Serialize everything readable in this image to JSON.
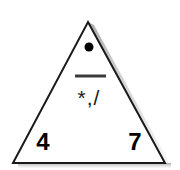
{
  "figure": {
    "shape": "triangle",
    "apex": {
      "x": 88,
      "y": 22
    },
    "bottom_left": {
      "x": 13,
      "y": 163
    },
    "bottom_right": {
      "x": 165,
      "y": 163
    },
    "stroke_color": "#1a1a1a",
    "fill_color": "#ffffff",
    "shadow_color": "#b5b5b5",
    "background_color": "#ffffff"
  },
  "marks": {
    "dot": {
      "name": "dot-marker",
      "center_x": 89,
      "center_y": 47,
      "radius": 4.5,
      "color": "#000000"
    },
    "bar": {
      "name": "horizontal-bar",
      "x1": 75,
      "x2": 106,
      "y": 76,
      "thickness": 3,
      "color": "#3a3a3a"
    },
    "middle_symbols": "*,/",
    "corner_left_value": "4",
    "corner_right_value": "7"
  }
}
